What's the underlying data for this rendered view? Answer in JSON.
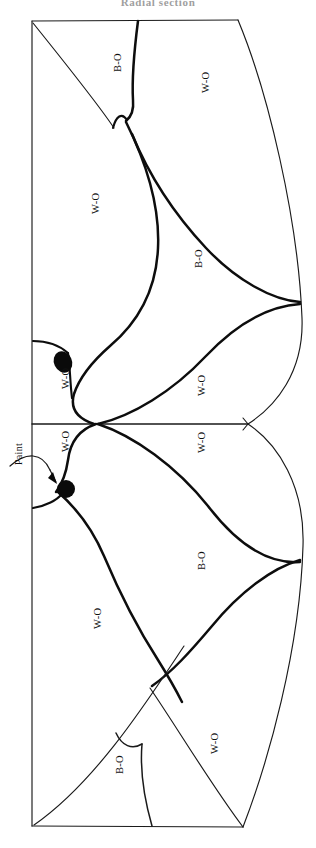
{
  "figure": {
    "title": "Radial section",
    "type": "line-drawing",
    "orientation": "rotated-90",
    "background_color": "#ffffff",
    "ink_color": "#111111"
  },
  "legend_terms": {
    "white_oak": "W-O",
    "black_oak": "B-O",
    "paint": "Paint"
  },
  "annotations": [
    {
      "id": "paint-callout",
      "label": "Paint",
      "kind": "leader-arrow",
      "target": "lower-blob"
    }
  ],
  "markers": [
    {
      "id": "upper-blob",
      "name": "paint-blob-upper",
      "shape": "filled-ellipse",
      "color": "#0a0a0a",
      "cx": 63,
      "cy": 362,
      "rx": 9,
      "ry": 11,
      "rotation": -25
    },
    {
      "id": "lower-blob",
      "name": "paint-blob-lower",
      "shape": "filled-circle",
      "color": "#0a0a0a",
      "cx": 66,
      "cy": 489,
      "r": 9
    }
  ],
  "region_labels": [
    {
      "id": "r1",
      "text": "B-O",
      "x": 112,
      "y": 72,
      "half": "upper"
    },
    {
      "id": "r2",
      "text": "W-O",
      "x": 200,
      "y": 93,
      "half": "upper"
    },
    {
      "id": "r3",
      "text": "W-O",
      "x": 90,
      "y": 214,
      "half": "upper"
    },
    {
      "id": "r4",
      "text": "B-O",
      "x": 193,
      "y": 268,
      "half": "upper"
    },
    {
      "id": "r5",
      "text": "W-O",
      "x": 60,
      "y": 389,
      "half": "upper"
    },
    {
      "id": "r6",
      "text": "W-O",
      "x": 196,
      "y": 396,
      "half": "upper"
    },
    {
      "id": "r7",
      "text": "W-O",
      "x": 60,
      "y": 452,
      "half": "lower"
    },
    {
      "id": "r8",
      "text": "W-O",
      "x": 196,
      "y": 453,
      "half": "lower"
    },
    {
      "id": "r9",
      "text": "B-O",
      "x": 196,
      "y": 570,
      "half": "lower"
    },
    {
      "id": "r10",
      "text": "W-O",
      "x": 92,
      "y": 629,
      "half": "lower"
    },
    {
      "id": "r11",
      "text": "W-O",
      "x": 209,
      "y": 754,
      "half": "lower"
    },
    {
      "id": "r12",
      "text": "B-O",
      "x": 114,
      "y": 774,
      "half": "lower"
    },
    {
      "id": "r13",
      "text": "Paint",
      "x": 13,
      "y": 465,
      "half": "lower"
    }
  ],
  "geometry": {
    "board_left_x": 32,
    "board_top_y": 21,
    "board_bottom_y": 826,
    "mid_divider_y": 424,
    "mid_divider_x_start": 32,
    "mid_divider_x_end": 248,
    "top_right_corner_x": 238,
    "bottom_right_corner_x": 243
  }
}
